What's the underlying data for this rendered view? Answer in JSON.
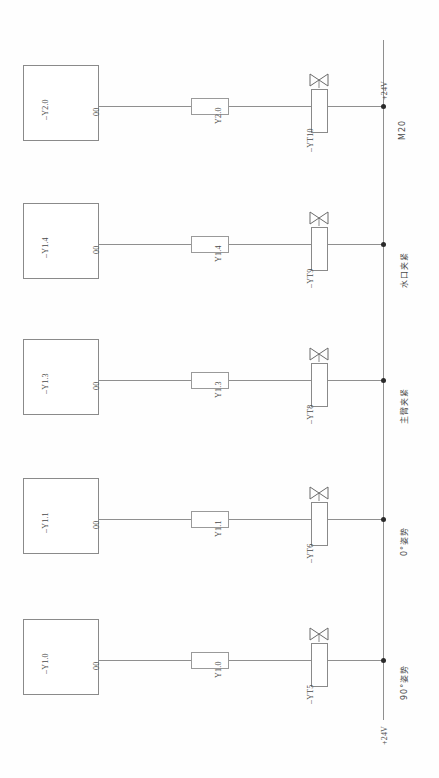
{
  "diagram": {
    "orientation": "rotated-90",
    "rail": {
      "top_label": "+24V",
      "bottom_label": "+24V",
      "color": "#8f8f8f"
    },
    "circuits": [
      {
        "source_label": "–Y2.0",
        "port_label": "00",
        "wire_label": "Y2.0",
        "valve_label": "–YT10",
        "node_label": "M20",
        "function": "M20"
      },
      {
        "source_label": "–Y1.4",
        "port_label": "00",
        "wire_label": "Y1.4",
        "valve_label": "–YT9",
        "node_label": "水口夹紧",
        "function": "水口夹紧"
      },
      {
        "source_label": "–Y1.3",
        "port_label": "00",
        "wire_label": "Y1.3",
        "valve_label": "–YT8",
        "node_label": "主臂夹紧",
        "function": "主臂夹紧"
      },
      {
        "source_label": "–Y1.1",
        "port_label": "00",
        "wire_label": "Y1.1",
        "valve_label": "–YT6",
        "node_label": "0°姿势",
        "function": "0°姿势"
      },
      {
        "source_label": "–Y1.0",
        "port_label": "00",
        "wire_label": "Y1.0",
        "valve_label": "–YT5",
        "node_label": "90°姿势",
        "function": "90°姿势"
      }
    ]
  },
  "colors": {
    "line": "#8f8f8f",
    "box": "#8a8a8a",
    "text": "#4a4a4a",
    "node": "#2a2a2a",
    "background": "#fefefe"
  }
}
